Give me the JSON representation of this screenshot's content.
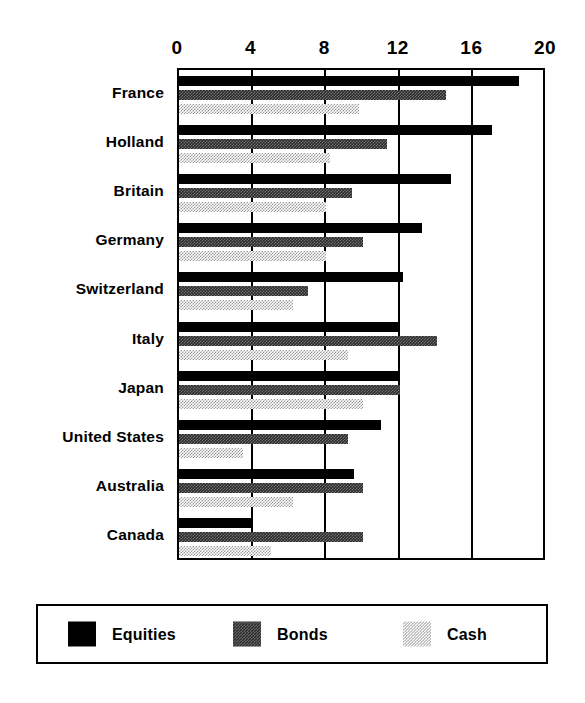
{
  "chart_data": {
    "type": "bar",
    "orientation": "horizontal",
    "title": "",
    "subtitle": "",
    "xlabel": "",
    "ylabel": "",
    "xlim": [
      0,
      20
    ],
    "xticks": [
      0,
      4,
      8,
      12,
      16,
      20
    ],
    "xtick_labels": [
      "0",
      "4",
      "8",
      "12",
      "16",
      "20"
    ],
    "grid": true,
    "grid_axis": "x",
    "legend_position": "bottom",
    "categories": [
      "France",
      "Holland",
      "Britain",
      "Germany",
      "Switzerland",
      "Italy",
      "Japan",
      "United States",
      "Australia",
      "Canada"
    ],
    "series": [
      {
        "name": "Equities",
        "color": "#000000",
        "fill": "solid-black",
        "values": [
          18.5,
          17.0,
          14.8,
          13.2,
          12.2,
          12.0,
          12.0,
          11.0,
          9.5,
          4.0
        ]
      },
      {
        "name": "Bonds",
        "color": "#2b2b2b",
        "fill": "dark-dither",
        "values": [
          14.5,
          11.3,
          9.4,
          10.0,
          7.0,
          14.0,
          12.0,
          9.2,
          10.0,
          10.0
        ]
      },
      {
        "name": "Cash",
        "color": "#9a9a9a",
        "fill": "light-dither",
        "values": [
          9.8,
          8.2,
          8.0,
          8.0,
          6.2,
          9.2,
          10.0,
          3.5,
          6.2,
          5.0
        ]
      }
    ]
  },
  "legend": {
    "items": [
      {
        "label": "Equities",
        "swatch": "equities-swatch"
      },
      {
        "label": "Bonds",
        "swatch": "bonds-swatch"
      },
      {
        "label": "Cash",
        "swatch": "cash-swatch"
      }
    ]
  },
  "colors": {
    "background": "#ffffff",
    "axis": "#000000",
    "equities": "#000000",
    "bonds": "#2b2b2b",
    "cash": "#9a9a9a"
  }
}
